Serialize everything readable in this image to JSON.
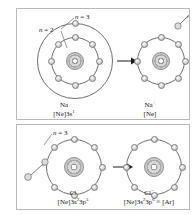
{
  "figure": {
    "faint_top_text": "",
    "accent_color": "#6f6f6f",
    "ink_color": "#111111",
    "electron_fill": "#dcdcdc",
    "panel_border": "#b9b9b9"
  },
  "panels": [
    {
      "id": "sodium",
      "shell_labels": [
        {
          "text_n": "n",
          "eq": " = ",
          "value": "3"
        },
        {
          "text_n": "n",
          "eq": " = ",
          "value": "2"
        }
      ],
      "left_atom": {
        "name": "Na",
        "symbol": "Na",
        "charge": "",
        "configuration_prefix": "[Ne]3s",
        "configuration_sup": "1",
        "configuration_suffix": "",
        "shells": [
          {
            "label": "n = 2",
            "electrons": 8,
            "radius": 22
          },
          {
            "label": "n = 3",
            "electrons": 1,
            "radius": 37
          }
        ]
      },
      "right_atom": {
        "name": "Na+",
        "symbol": "Na",
        "charge": "+",
        "configuration_prefix": "[Ne]",
        "configuration_sup": "",
        "configuration_suffix": "",
        "shells": [
          {
            "label": "n = 2",
            "electrons": 8,
            "radius": 22
          }
        ]
      },
      "transition": "loses one electron",
      "free_electron": {
        "position": "top-right",
        "direction": "leaving"
      }
    },
    {
      "id": "chlorine",
      "shell_labels": [
        {
          "text_n": "n",
          "eq": " = ",
          "value": "3"
        }
      ],
      "left_atom": {
        "name": "Cl",
        "symbol": "Cl",
        "charge": "",
        "configuration_prefix": "[Ne]3s",
        "configuration_sup": "2",
        "configuration_mid": "3p",
        "configuration_sup2": "5",
        "configuration_suffix": "",
        "shells": [
          {
            "label": "n = 3",
            "electrons": 7,
            "radius": 27
          }
        ]
      },
      "right_atom": {
        "name": "Cl-",
        "symbol": "Cl",
        "charge": "−",
        "configuration_prefix": "[Ne]3s",
        "configuration_sup": "2",
        "configuration_mid": "3p",
        "configuration_sup2": "6",
        "configuration_suffix": " ≡ [Ar]",
        "shells": [
          {
            "label": "n = 3",
            "electrons": 8,
            "radius": 27
          }
        ]
      },
      "transition": "gains one electron",
      "free_electron": {
        "position": "lower-left",
        "direction": "arriving"
      }
    }
  ],
  "captions": {
    "na_symbol": "Na",
    "na_config_pre": "[Ne]3s",
    "na_config_sup": "1",
    "na_ion_symbol": "Na",
    "na_ion_charge": "+",
    "na_ion_config": "[Ne]",
    "cl_symbol": "Cl",
    "cl_config_pre": "[Ne]3s",
    "cl_config_sup1": "2",
    "cl_config_mid": "3p",
    "cl_config_sup2": "5",
    "cl_ion_symbol": "Cl",
    "cl_ion_charge": "−",
    "cl_ion_config_pre": "[Ne]3s",
    "cl_ion_config_sup1": "2",
    "cl_ion_config_mid": "3p",
    "cl_ion_config_sup2": "6",
    "cl_ion_config_tail": " ≡ [Ar]"
  },
  "labels": {
    "n3_top": "n = 3",
    "n2_top": "n = 2",
    "n3_bottom": "n = 3",
    "n_italic": "n",
    "eq3": " = 3",
    "eq2": " = 2"
  }
}
